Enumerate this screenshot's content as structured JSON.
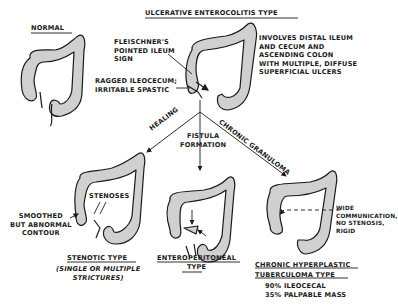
{
  "title": "ULCERATIVE ENTEROCOLITIS TYPE",
  "normal": {
    "label": "NORMAL"
  },
  "ulcerative": {
    "annotation_fleischner": [
      "FLEISCHNER'S",
      "POINTED ILEUM",
      "SIGN"
    ],
    "annotation_ragged": [
      "RAGGED ILEOCECUM;",
      "IRRITABLE SPASTIC"
    ],
    "description": [
      "INVOLVES DISTAL ILEUM",
      "AND CECUM AND",
      "ASCENDING COLON",
      "WITH MULTIPLE, DIFFUSE",
      "SUPERFICIAL ULCERS"
    ]
  },
  "branches": {
    "left": "HEALING",
    "center": [
      "FISTULA",
      "FORMATION"
    ],
    "right": "CHRONIC GRANULOMA"
  },
  "stenotic": {
    "annotation_stenoses": "STENOSES",
    "annotation_contour": [
      "SMOOTHED",
      "BUT ABNORMAL",
      "CONTOUR"
    ],
    "title": "STENOTIC TYPE",
    "subtitle": [
      "(SINGLE OR MULTIPLE",
      "STRICTURES)"
    ]
  },
  "enteroperitoneal": {
    "title": [
      "ENTEROPERITONEAL",
      "TYPE"
    ]
  },
  "hyperplastic": {
    "annotation": [
      "WIDE",
      "COMMUNICATION,",
      "NO STENOSIS,",
      "RIGID"
    ],
    "title": [
      "CHRONIC HYPERPLASTIC",
      "TUBERCULOMA TYPE"
    ],
    "stats": [
      "90% ILEOCECAL",
      "35% PALPABLE MASS"
    ]
  },
  "colors": {
    "ink": "#1a1a1a",
    "fill": "#cfcfcf",
    "background": "#ffffff"
  }
}
